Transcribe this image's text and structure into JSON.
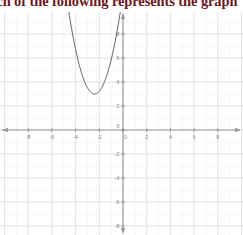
{
  "header": {
    "question_text": "Which of the following represents the graph"
  },
  "chart_data": {
    "type": "line",
    "title": "",
    "subtitle": "",
    "xlabel": "",
    "ylabel": "",
    "xlim": [
      -9.2,
      9.2
    ],
    "ylim": [
      -9.2,
      9.2
    ],
    "grid": true,
    "legend_position": "none",
    "x_ticks": [
      -8,
      -6,
      -4,
      -2,
      0,
      2,
      4,
      6,
      8
    ],
    "y_ticks": [
      8,
      6,
      4,
      2,
      0,
      -2,
      -4,
      -6,
      -8
    ],
    "x_tick_labels": [
      "-8",
      "-6",
      "-4",
      "-2",
      "0",
      "2",
      "4",
      "6",
      "8"
    ],
    "y_tick_labels": [
      "8",
      "6",
      "4",
      "2",
      "0",
      "-2",
      "-4",
      "-6",
      "-8"
    ],
    "origin_label": "0",
    "grid_step_major": 2,
    "grid_step_minor": 1,
    "axis_color": "#9a9a9a",
    "grid_color": "#dcdcdc",
    "curve_color": "#5a5a5a",
    "annotations": [],
    "series": [
      {
        "name": "parabola",
        "shape": "parabola",
        "opens": "up",
        "vertex": [
          -2.4,
          3.0
        ],
        "leading_coefficient": 1.45,
        "equation": "y = 1.45(x + 2.4)^2 + 3",
        "x": [
          -4.5,
          -4.25,
          -4.0,
          -3.75,
          -3.5,
          -3.25,
          -3.0,
          -2.75,
          -2.5,
          -2.4,
          -2.25,
          -2.0,
          -1.75,
          -1.5,
          -1.25,
          -1.0,
          -0.75,
          -0.5,
          -0.35
        ],
        "y": [
          9.1,
          7.9,
          6.7,
          5.7,
          4.8,
          4.0,
          3.5,
          3.1,
          3.0,
          3.0,
          3.0,
          3.2,
          3.6,
          4.2,
          5.0,
          5.8,
          6.9,
          8.1,
          9.0
        ]
      }
    ]
  }
}
